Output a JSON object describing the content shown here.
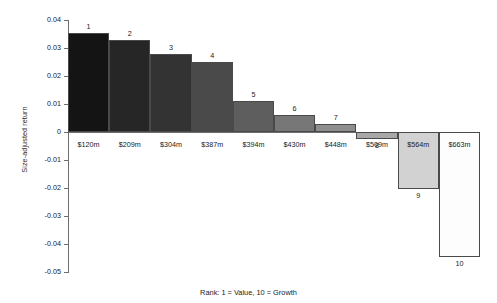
{
  "chart_data": {
    "type": "bar",
    "title": "",
    "subtitle": "",
    "xlabel": "Rank: 1 = Value, 10 = Growth",
    "ylabel": "Size-adjusted return",
    "ylim": [
      -0.05,
      0.04
    ],
    "ytick_labels": [
      "0.04",
      "0.03",
      "0.02",
      "0.01",
      "0",
      "-0.01",
      "-0.02",
      "-0.03",
      "-0.04",
      "-0.05"
    ],
    "ytick_values": [
      0.04,
      0.03,
      0.02,
      0.01,
      0,
      -0.01,
      -0.02,
      -0.03,
      -0.04,
      -0.05
    ],
    "grid": false,
    "legend": "none",
    "categories": [
      "$120m",
      "$209m",
      "$304m",
      "$387m",
      "$394m",
      "$430m",
      "$448m",
      "$509m",
      "$564m",
      "$663m"
    ],
    "values": [
      0.0354,
      0.033,
      0.0277,
      0.025,
      0.011,
      0.0062,
      0.003,
      -0.0025,
      -0.0205,
      -0.0445
    ],
    "point_labels": [
      "1",
      "2",
      "3",
      "4",
      "5",
      "6",
      "7",
      "8",
      "9",
      "10"
    ],
    "bar_colors": [
      "#141414",
      "#262626",
      "#333333",
      "#4a4a4a",
      "#5e5e5e",
      "#777777",
      "#8e8e8e",
      "#a8a8a8",
      "#d2d2d2",
      "#fdfdfd"
    ],
    "bar_edge_color": "#4a4a4a",
    "series_name": "Size-adjusted return"
  }
}
